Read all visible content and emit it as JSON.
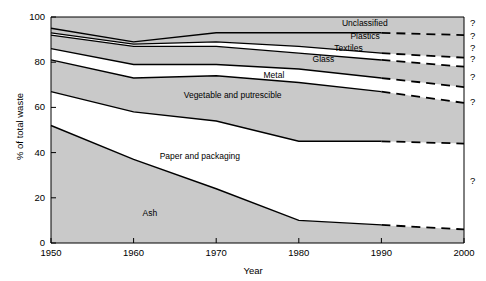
{
  "chart_data": {
    "type": "area",
    "title": "",
    "xlabel": "Year",
    "ylabel": "% of total waste",
    "xlim": [
      1950,
      2000
    ],
    "ylim": [
      0,
      100
    ],
    "grid": false,
    "legend_position": "inline-labels",
    "x": [
      1950,
      1960,
      1970,
      1980,
      1990,
      2000
    ],
    "xticks": [
      "1950",
      "1960",
      "1970",
      "1980",
      "1990",
      "2000"
    ],
    "yticks": [
      "0",
      "20",
      "40",
      "60",
      "80",
      "100"
    ],
    "stacked_cumulative_tops": {
      "Ash": [
        52,
        37,
        24,
        10,
        8,
        6
      ],
      "Paper and packaging": [
        67,
        58,
        54,
        45,
        45,
        44
      ],
      "Vegetable and putrescible": [
        81,
        73,
        74,
        71,
        67,
        62
      ],
      "Metal": [
        86,
        79,
        79,
        77,
        73,
        69
      ],
      "Glass": [
        92,
        87,
        87,
        84,
        81,
        78
      ],
      "Textiles": [
        93,
        88,
        89,
        87,
        84,
        82
      ],
      "Plastics": [
        95,
        89,
        93,
        93,
        93,
        92
      ],
      "Unclassified": [
        100,
        100,
        100,
        100,
        100,
        100
      ]
    },
    "series": [
      {
        "name": "Ash",
        "values": [
          52,
          37,
          24,
          10,
          8,
          6
        ],
        "fill": "gray"
      },
      {
        "name": "Paper and packaging",
        "values": [
          15,
          21,
          30,
          35,
          37,
          38
        ],
        "fill": "white"
      },
      {
        "name": "Vegetable and putrescible",
        "values": [
          14,
          15,
          20,
          26,
          22,
          18
        ],
        "fill": "gray"
      },
      {
        "name": "Metal",
        "values": [
          5,
          6,
          5,
          6,
          6,
          7
        ],
        "fill": "white"
      },
      {
        "name": "Glass",
        "values": [
          6,
          8,
          8,
          7,
          8,
          9
        ],
        "fill": "gray"
      },
      {
        "name": "Textiles",
        "values": [
          1,
          1,
          2,
          3,
          3,
          4
        ],
        "fill": "white"
      },
      {
        "name": "Plastics",
        "values": [
          2,
          1,
          4,
          6,
          9,
          10
        ],
        "fill": "gray"
      },
      {
        "name": "Unclassified",
        "values": [
          5,
          11,
          7,
          7,
          7,
          8
        ],
        "fill": "gray"
      }
    ],
    "projection": {
      "starts_at": 1990,
      "style": "dashed",
      "marker": "?",
      "marker_count": 7
    },
    "band_labels": [
      {
        "text": "Unclassified",
        "x": 1988,
        "y": 97
      },
      {
        "text": "Plastics",
        "x": 1988,
        "y": 91
      },
      {
        "text": "Textiles",
        "x": 1986,
        "y": 86
      },
      {
        "text": "Glass",
        "x": 1983,
        "y": 81
      },
      {
        "text": "Metal",
        "x": 1977,
        "y": 74
      },
      {
        "text": "Vegetable and putrescible",
        "x": 1972,
        "y": 65
      },
      {
        "text": "Paper and packaging",
        "x": 1968,
        "y": 38
      },
      {
        "text": "Ash",
        "x": 1962,
        "y": 13
      }
    ],
    "colors": {
      "fill_gray": "#c9c9c9",
      "fill_white": "#ffffff",
      "line": "#000000",
      "axis": "#000000",
      "text": "#000000",
      "background": "#ffffff"
    }
  }
}
